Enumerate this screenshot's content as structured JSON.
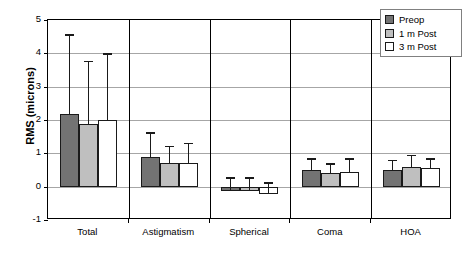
{
  "chart_data": {
    "type": "bar",
    "title": "",
    "xlabel": "",
    "ylabel": "RMS (microns)",
    "ylim": [
      -1,
      5
    ],
    "yticks": [
      5,
      4,
      3,
      2,
      1,
      0,
      -1
    ],
    "ytick_labels": [
      "5",
      "4",
      "3",
      "2",
      "1",
      "0",
      "-1"
    ],
    "grid": true,
    "legend_position": "top-right",
    "categories": [
      "Total",
      "Astigmatism",
      "Spherical",
      "Coma",
      "HOA"
    ],
    "series": [
      {
        "name": "Preop",
        "color": "#737373",
        "values": [
          2.17,
          0.88,
          -0.12,
          0.5,
          0.5
        ],
        "errors": [
          2.4,
          0.75,
          0.4,
          0.35,
          0.3
        ]
      },
      {
        "name": "1 m Post",
        "color": "#bfbfbf",
        "values": [
          1.88,
          0.72,
          -0.12,
          0.42,
          0.6
        ],
        "errors": [
          1.9,
          0.5,
          0.4,
          0.28,
          0.35
        ]
      },
      {
        "name": "3 m Post",
        "color": "#ffffff",
        "values": [
          2.0,
          0.72,
          -0.22,
          0.45,
          0.55
        ],
        "errors": [
          2.0,
          0.6,
          0.35,
          0.4,
          0.3
        ]
      }
    ]
  },
  "legend": {
    "items": [
      {
        "label": "Preop"
      },
      {
        "label": "1 m Post"
      },
      {
        "label": "3 m Post"
      }
    ]
  }
}
